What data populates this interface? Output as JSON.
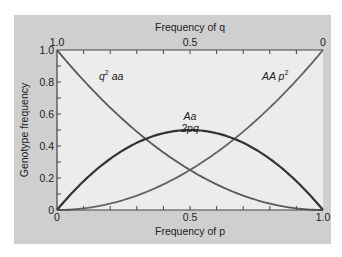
{
  "chart_data": {
    "type": "line",
    "title": "",
    "xlabel": "Frequency of p",
    "x2label": "Frequency of q",
    "ylabel": "Genotype frequency",
    "xlim": [
      0,
      1.0
    ],
    "ylim": [
      0,
      1.0
    ],
    "grid": false,
    "x_ticks": [
      "0",
      "0.5",
      "1.0"
    ],
    "x2_ticks": [
      "1.0",
      "0.5",
      "0"
    ],
    "y_ticks": [
      "0",
      "0.2",
      "0.4",
      "0.6",
      "0.8",
      "1.0"
    ],
    "x": [
      0,
      0.1,
      0.2,
      0.3,
      0.4,
      0.5,
      0.6,
      0.7,
      0.8,
      0.9,
      1.0
    ],
    "series": [
      {
        "name": "q² aa",
        "label_main": "q",
        "label_sup": "2",
        "label_rest": " aa",
        "values": [
          1.0,
          0.81,
          0.64,
          0.49,
          0.36,
          0.25,
          0.16,
          0.09,
          0.04,
          0.01,
          0.0
        ],
        "color": "#585858"
      },
      {
        "name": "AA p²",
        "label_main": "AA p",
        "label_sup": "2",
        "values": [
          0.0,
          0.01,
          0.04,
          0.09,
          0.16,
          0.25,
          0.36,
          0.49,
          0.64,
          0.81,
          1.0
        ],
        "color": "#646464"
      },
      {
        "name": "Aa 2pq",
        "label_line1": "Aa",
        "label_line2": "2pq",
        "values": [
          0.0,
          0.18,
          0.32,
          0.42,
          0.48,
          0.5,
          0.48,
          0.42,
          0.32,
          0.18,
          0.0
        ],
        "color": "#333333"
      }
    ]
  },
  "colors": {
    "panel": "#cfcfcf",
    "plot_bg": "#ececec",
    "axis": "#444444"
  }
}
